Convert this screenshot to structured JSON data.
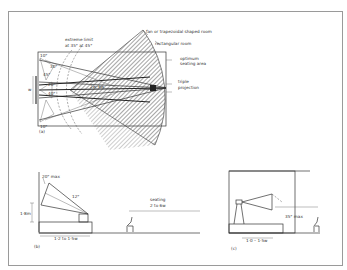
{
  "figure": {
    "panel_a": {
      "tag": "(a)",
      "labels": {
        "fan_room": "fan or trapezoidal shaped room",
        "rect_room": "rectangular room",
        "optimum_1": "optimum",
        "optimum_2": "seating area",
        "triple_1": "triple",
        "triple_2": "projection",
        "extreme_1": "extreme limit",
        "extreme_2": "at 35°  at 45°",
        "w": "w",
        "dist": "2w–6w",
        "a10_top": "10°",
        "a30": "30°",
        "a45": "45°",
        "a20": "20°",
        "a40": "40°",
        "a10_bot": "10°"
      }
    },
    "panel_b": {
      "tag": "(b)",
      "labels": {
        "max20": "20° max",
        "a12": "12°",
        "height": "1·8m",
        "seating_1": "seating",
        "seating_2": "2 to 6w",
        "base": "1·2 to 1·5w"
      }
    },
    "panel_c": {
      "tag": "(c)",
      "labels": {
        "max35": "35° max",
        "base": "1·0 – 1·5w"
      }
    }
  }
}
